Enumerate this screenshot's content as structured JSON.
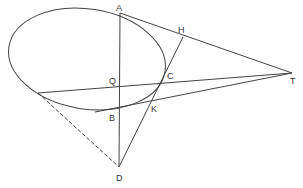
{
  "diagram": {
    "title": "",
    "stroke_color": "#444444",
    "labels": {
      "A": "A",
      "H": "H",
      "Q": "Q",
      "C": "C",
      "T": "T",
      "B": "B",
      "K": "K",
      "D": "D"
    },
    "points": {
      "A": [
        120,
        13
      ],
      "H": [
        183,
        37
      ],
      "C": [
        163,
        82
      ],
      "Q": [
        120,
        87
      ],
      "B": [
        120,
        110
      ],
      "K": [
        150,
        102
      ],
      "T": [
        292,
        73
      ],
      "D": [
        119,
        167
      ],
      "L": [
        38,
        93
      ]
    },
    "ellipse": {
      "cx": 87,
      "cy": 59,
      "rx": 79,
      "ry": 50,
      "rotate": 9
    }
  }
}
